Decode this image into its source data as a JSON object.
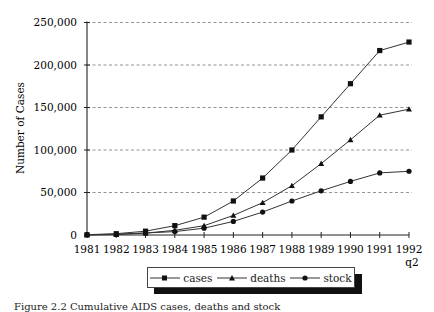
{
  "chart_data": {
    "type": "line",
    "title": "",
    "xlabel": "",
    "ylabel": "Number of Cases",
    "ylim": [
      0,
      250000
    ],
    "yticks": [
      "0",
      "50,000",
      "100,000",
      "150,000",
      "200,000",
      "250,000"
    ],
    "x": [
      "1981",
      "1982",
      "1983",
      "1984",
      "1985",
      "1986",
      "1987",
      "1988",
      "1989",
      "1990",
      "1991",
      "1992 q2"
    ],
    "x_tick_labels": [
      "1981",
      "1982",
      "1983",
      "1984",
      "1985",
      "1986",
      "1987",
      "1988",
      "1989",
      "1990",
      "1991",
      "1992"
    ],
    "x_tick_sublabel": "q2",
    "grid": "horizontal dashed",
    "legend_position": "bottom, boxed with drop shadow",
    "series": [
      {
        "name": "cases",
        "marker": "square",
        "values": [
          300,
          1500,
          4500,
          11000,
          21000,
          40000,
          67000,
          100000,
          139000,
          178000,
          217000,
          227000
        ]
      },
      {
        "name": "deaths",
        "marker": "triangle",
        "values": [
          100,
          600,
          2200,
          5500,
          11000,
          23000,
          38000,
          58000,
          84000,
          112000,
          141000,
          148000
        ]
      },
      {
        "name": "stock",
        "marker": "circle",
        "values": [
          200,
          900,
          2300,
          4000,
          8000,
          16000,
          27000,
          40000,
          52000,
          63000,
          73000,
          75000
        ]
      }
    ]
  },
  "legend": {
    "items": [
      {
        "label": "cases",
        "marker": "square-marker-icon"
      },
      {
        "label": "deaths",
        "marker": "triangle-marker-icon"
      },
      {
        "label": "stock",
        "marker": "circle-marker-icon"
      }
    ]
  },
  "caption": "Figure 2.2  Cumulative AIDS cases, deaths and stock"
}
